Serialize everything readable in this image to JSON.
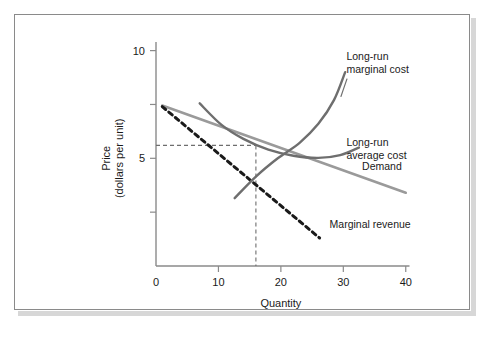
{
  "figure": {
    "background": "#ffffff",
    "frame_color": "#8a8a8a",
    "shadow_color": "#d7d7d7"
  },
  "chart_data": {
    "type": "line",
    "title": "",
    "xlabel": "Quantity",
    "ylabel_line1": "Price",
    "ylabel_line2": "(dollars per unit)",
    "xlim": [
      0,
      41
    ],
    "ylim": [
      0,
      10.4
    ],
    "xticks": [
      0,
      10,
      20,
      30,
      40
    ],
    "xtick_labels": [
      "0",
      "10",
      "20",
      "30",
      "40"
    ],
    "yticks": [
      0,
      2.5,
      5,
      7.5,
      10
    ],
    "ytick_labels": [
      "",
      "",
      "5",
      "",
      "10"
    ],
    "grid": false,
    "legend": "inline-annotations",
    "annotations": {
      "equilibrium_price": 5.6,
      "equilibrium_quantity": 16
    },
    "series": [
      {
        "name": "Demand",
        "label": "Demand",
        "style": "solid",
        "color": "#9a9a9a",
        "width": 2.6,
        "points": [
          [
            1.0,
            7.45
          ],
          [
            40.0,
            3.4
          ]
        ],
        "label_x": 33.0,
        "label_y": 4.45
      },
      {
        "name": "Marginal revenue",
        "label": "Marginal revenue",
        "style": "dashed",
        "color": "#1a1a1a",
        "width": 3.0,
        "points": [
          [
            1.0,
            7.4
          ],
          [
            26.2,
            1.3
          ]
        ],
        "label_x": 27.8,
        "label_y": 1.75
      },
      {
        "name": "Long-run marginal cost",
        "label": "Long-run marginal cost",
        "style": "solid",
        "color": "#6e6e6e",
        "width": 2.4,
        "points": [
          [
            12.6,
            3.15
          ],
          [
            16.0,
            4.15
          ],
          [
            19.5,
            5.0
          ],
          [
            23.0,
            5.72
          ],
          [
            26.0,
            6.6
          ],
          [
            28.5,
            7.7
          ],
          [
            30.3,
            9.0
          ]
        ],
        "label_x": 30.5,
        "label_y": 9.55,
        "leader": [
          [
            30.6,
            8.7
          ],
          [
            29.6,
            7.85
          ]
        ]
      },
      {
        "name": "Long-run average cost",
        "label": "Long-run average cost",
        "style": "solid",
        "color": "#6e6e6e",
        "width": 2.4,
        "points": [
          [
            7.0,
            7.55
          ],
          [
            10.5,
            6.55
          ],
          [
            14.0,
            5.9
          ],
          [
            18.0,
            5.4
          ],
          [
            22.0,
            5.12
          ],
          [
            26.0,
            5.02
          ],
          [
            29.5,
            5.15
          ],
          [
            32.5,
            5.5
          ]
        ],
        "label_x": 30.5,
        "label_y": 5.55
      }
    ],
    "guide_lines": [
      {
        "name": "price-guide",
        "style": "dashed",
        "color": "#6e6e6e",
        "from": [
          0,
          5.6
        ],
        "to": [
          16.0,
          5.6
        ]
      },
      {
        "name": "quantity-guide",
        "style": "dashed",
        "color": "#6e6e6e",
        "from": [
          16.0,
          5.6
        ],
        "to": [
          16.0,
          0
        ]
      }
    ]
  }
}
